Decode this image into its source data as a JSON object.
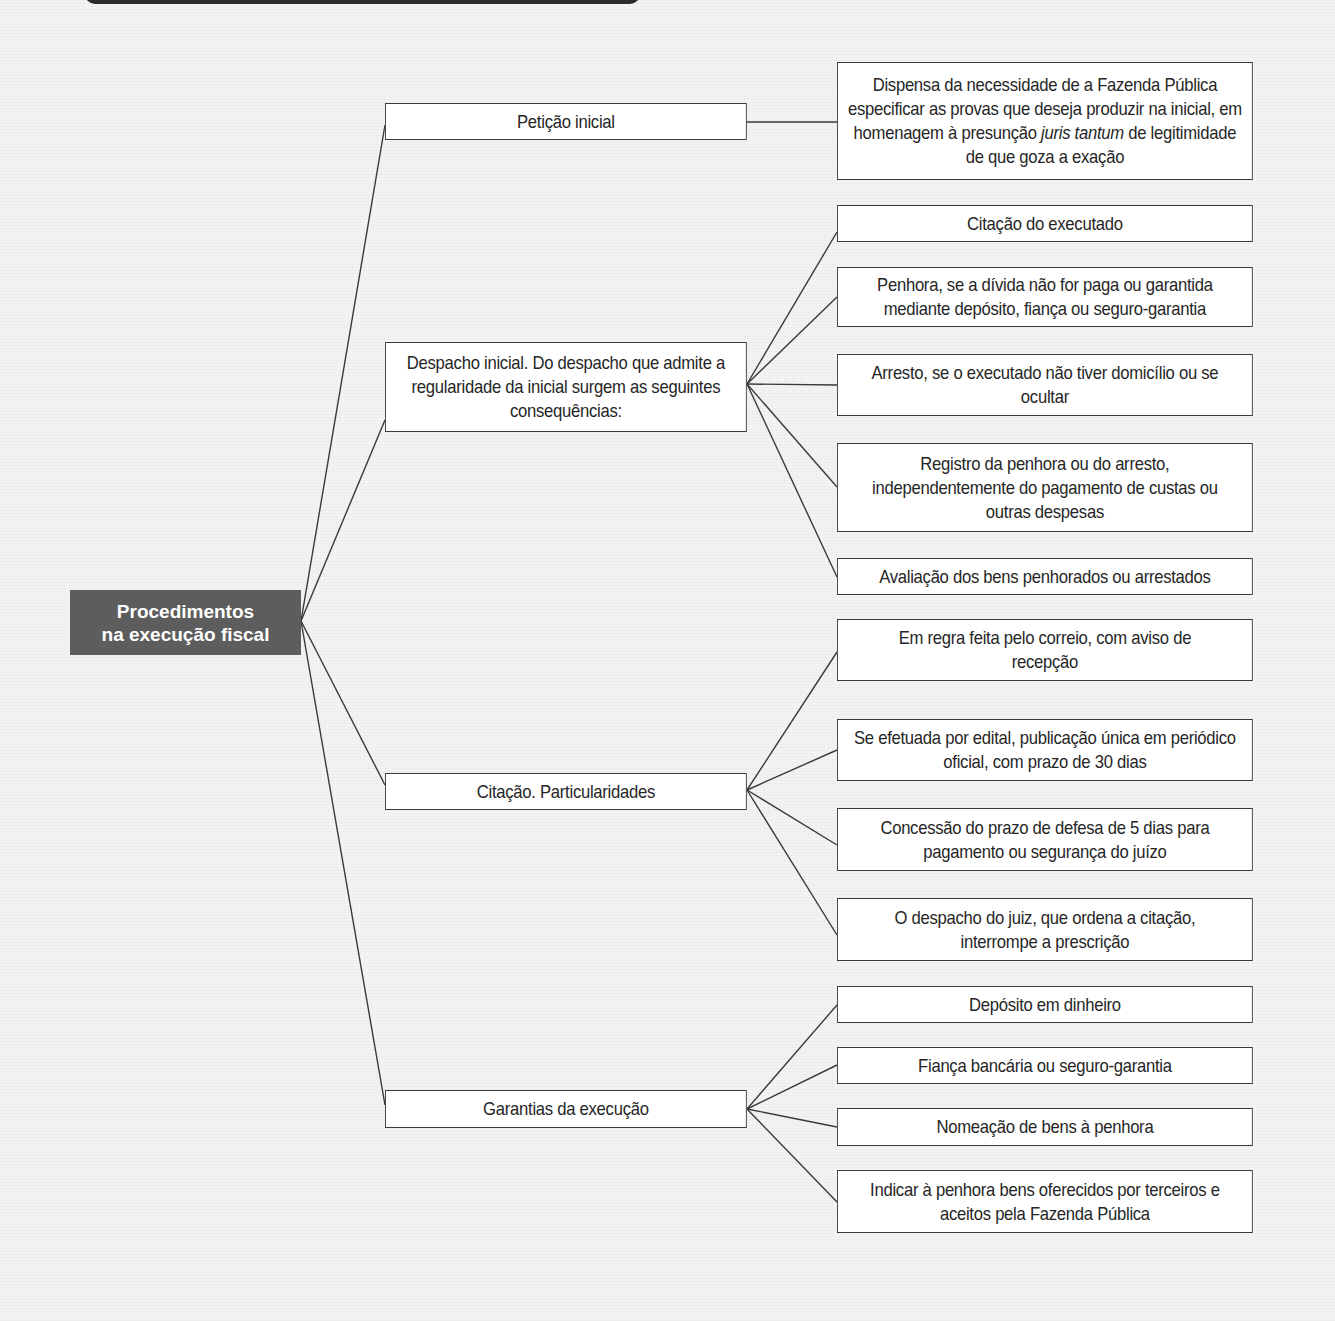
{
  "diagram": {
    "root": {
      "label_line1": "Procedimentos",
      "label_line2": "na execução fiscal",
      "fill_color": "#5d5d5d",
      "text_color": "#ffffff"
    },
    "branches": [
      {
        "label": "Petição inicial",
        "children": [
          {
            "label_pre": "Dispensa da necessidade de a Fazenda Pública especificar as provas que deseja produzir na inicial, em homenagem à presunção ",
            "label_italic": "juris tantum",
            "label_post": " de legitimidade de que goza a exação"
          }
        ]
      },
      {
        "label": "Despacho inicial. Do despacho que admite a regularidade da inicial surgem as seguintes consequências:",
        "children": [
          {
            "label": "Citação do executado"
          },
          {
            "label": "Penhora, se a dívida não for paga ou garantida mediante depósito, fiança ou seguro-garantia"
          },
          {
            "label": "Arresto, se o executado não tiver domicílio ou se ocultar"
          },
          {
            "label": "Registro da penhora ou do arresto, independentemente do pagamento de custas ou outras despesas"
          },
          {
            "label": "Avaliação dos bens penhorados ou arrestados"
          }
        ]
      },
      {
        "label": "Citação. Particularidades",
        "children": [
          {
            "label": "Em regra feita pelo correio, com aviso de recepção"
          },
          {
            "label": "Se efetuada por edital, publicação única em periódico oficial, com prazo de 30 dias"
          },
          {
            "label": "Concessão do prazo de defesa de 5 dias para pagamento ou segurança do juízo"
          },
          {
            "label": "O despacho do juiz, que ordena a citação, interrompe a prescrição"
          }
        ]
      },
      {
        "label": "Garantias da execução",
        "children": [
          {
            "label": "Depósito em dinheiro"
          },
          {
            "label": "Fiança bancária ou seguro-garantia"
          },
          {
            "label": "Nomeação de bens à penhora"
          },
          {
            "label": "Indicar à penhora bens oferecidos por terceiros e aceitos pela Fazenda Pública"
          }
        ]
      }
    ],
    "colors": {
      "line": "#3a3a3a",
      "box_border": "#3a3a3a",
      "background": "#f3f3f1"
    }
  }
}
